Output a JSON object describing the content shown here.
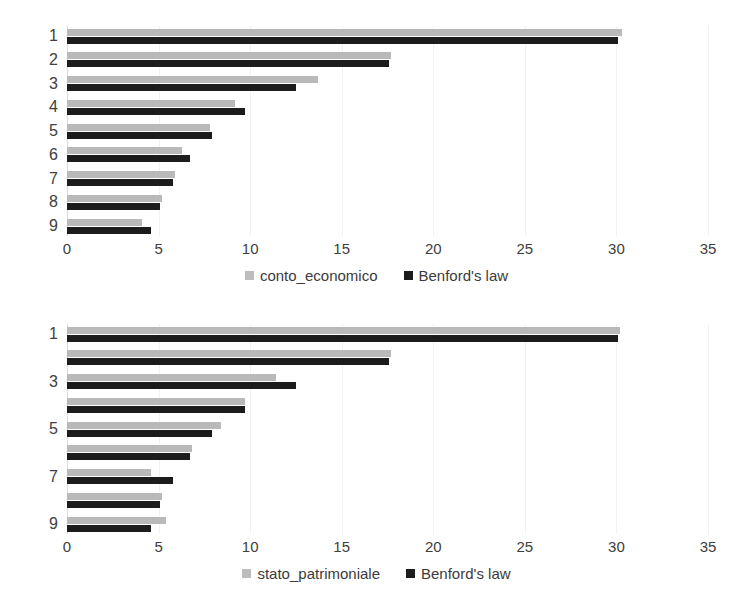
{
  "figure": {
    "background": "#ffffff",
    "grid": true,
    "series_colors": {
      "observed": "#b9b9b9",
      "benford": "#1c1c1c"
    }
  },
  "charts": [
    {
      "id": "conto-economico",
      "ylabels": [
        "1",
        "2",
        "3",
        "4",
        "5",
        "6",
        "7",
        "8",
        "9"
      ],
      "xticks": [
        "0",
        "5",
        "10",
        "15",
        "20",
        "25",
        "30",
        "35"
      ],
      "legend": [
        {
          "label": "conto_economico",
          "swatch": "series-a"
        },
        {
          "label": "Benford's law",
          "swatch": "series-b"
        }
      ]
    },
    {
      "id": "stato-patrimoniale",
      "ylabels": [
        "1",
        "",
        "3",
        "",
        "5",
        "",
        "7",
        "",
        "9"
      ],
      "xticks": [
        "0",
        "5",
        "10",
        "15",
        "20",
        "25",
        "30",
        "35"
      ],
      "legend": [
        {
          "label": "stato_patrimoniale",
          "swatch": "series-a"
        },
        {
          "label": "Benford's law",
          "swatch": "series-b"
        }
      ]
    }
  ],
  "chart_data": [
    {
      "type": "bar",
      "orientation": "horizontal",
      "title": "",
      "xlabel": "",
      "ylabel": "",
      "categories": [
        "1",
        "2",
        "3",
        "4",
        "5",
        "6",
        "7",
        "8",
        "9"
      ],
      "series": [
        {
          "name": "conto_economico",
          "color": "#b9b9b9",
          "values": [
            30.3,
            17.7,
            13.7,
            9.2,
            7.8,
            6.3,
            5.9,
            5.2,
            4.1
          ]
        },
        {
          "name": "Benford's law",
          "color": "#1c1c1c",
          "values": [
            30.1,
            17.6,
            12.5,
            9.7,
            7.9,
            6.7,
            5.8,
            5.1,
            4.6
          ]
        }
      ],
      "xlim": [
        0,
        35
      ],
      "xticks": [
        0,
        5,
        10,
        15,
        20,
        25,
        30,
        35
      ],
      "grid": true,
      "legend_position": "bottom"
    },
    {
      "type": "bar",
      "orientation": "horizontal",
      "title": "",
      "xlabel": "",
      "ylabel": "",
      "categories": [
        "1",
        "2",
        "3",
        "4",
        "5",
        "6",
        "7",
        "8",
        "9"
      ],
      "series": [
        {
          "name": "stato_patrimoniale",
          "color": "#b9b9b9",
          "values": [
            30.2,
            17.7,
            11.4,
            9.7,
            8.4,
            6.8,
            4.6,
            5.2,
            5.4
          ]
        },
        {
          "name": "Benford's law",
          "color": "#1c1c1c",
          "values": [
            30.1,
            17.6,
            12.5,
            9.7,
            7.9,
            6.7,
            5.8,
            5.1,
            4.6
          ]
        }
      ],
      "xlim": [
        0,
        35
      ],
      "xticks": [
        0,
        5,
        10,
        15,
        20,
        25,
        30,
        35
      ],
      "grid": true,
      "legend_position": "bottom"
    }
  ]
}
